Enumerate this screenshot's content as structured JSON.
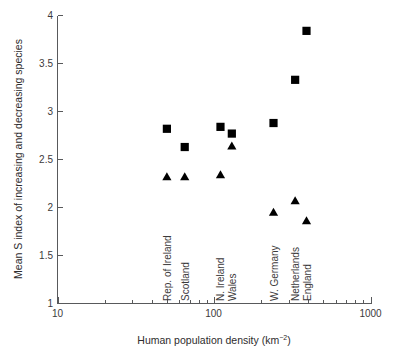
{
  "chart_data": {
    "type": "scatter",
    "title": "",
    "xlabel": "Human population density (km−2)",
    "ylabel": "Mean S index of increasing and decreasing species",
    "xscale": "log",
    "yscale": "linear",
    "xlim": [
      10,
      1000
    ],
    "ylim": [
      1,
      4
    ],
    "grid": false,
    "legend": "none",
    "x_tick_labels": [
      "10",
      "100",
      "1000"
    ],
    "x_tick_values": [
      10,
      100,
      1000
    ],
    "y_tick_labels": [
      "1",
      "1.5",
      "2",
      "2.5",
      "3",
      "3.5",
      "4"
    ],
    "y_tick_values": [
      1,
      1.5,
      2,
      2.5,
      3,
      3.5,
      4
    ],
    "categories": [
      "Rep. of Ireland",
      "Scotland",
      "N. Ireland",
      "Wales",
      "W. Germany",
      "Netherlands",
      "England"
    ],
    "category_x_values": [
      50,
      65,
      110,
      130,
      240,
      330,
      390
    ],
    "series": [
      {
        "name": "increasing species",
        "marker": "square",
        "color": "#000000",
        "points": [
          {
            "label": "Rep. of Ireland",
            "x": 50,
            "y": 2.82
          },
          {
            "label": "Scotland",
            "x": 65,
            "y": 2.63
          },
          {
            "label": "N. Ireland",
            "x": 110,
            "y": 2.84
          },
          {
            "label": "Wales",
            "x": 130,
            "y": 2.77
          },
          {
            "label": "W. Germany",
            "x": 240,
            "y": 2.88
          },
          {
            "label": "Netherlands",
            "x": 330,
            "y": 3.33
          },
          {
            "label": "England",
            "x": 390,
            "y": 3.84
          }
        ]
      },
      {
        "name": "decreasing species",
        "marker": "triangle",
        "color": "#000000",
        "points": [
          {
            "label": "Rep. of Ireland",
            "x": 50,
            "y": 2.32
          },
          {
            "label": "Scotland",
            "x": 65,
            "y": 2.32
          },
          {
            "label": "N. Ireland",
            "x": 110,
            "y": 2.34
          },
          {
            "label": "Wales",
            "x": 130,
            "y": 2.64
          },
          {
            "label": "W. Germany",
            "x": 240,
            "y": 1.95
          },
          {
            "label": "Netherlands",
            "x": 330,
            "y": 2.07
          },
          {
            "label": "England",
            "x": 390,
            "y": 1.86
          }
        ]
      }
    ]
  },
  "axis": {
    "x_label_main": "Human population density (km",
    "x_label_exponent": "−2",
    "x_label_close": ")",
    "y_label": "Mean S index of increasing and decreasing species"
  }
}
